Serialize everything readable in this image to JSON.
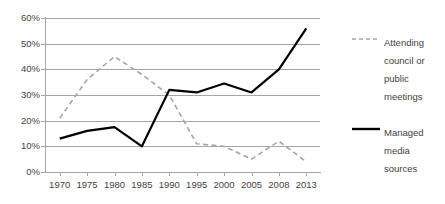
{
  "chart_data": {
    "type": "line",
    "title": "",
    "xlabel": "",
    "ylabel": "",
    "categories": [
      "1970",
      "1975",
      "1980",
      "1985",
      "1990",
      "1995",
      "2000",
      "2005",
      "2008",
      "2013"
    ],
    "ylim": [
      0,
      60
    ],
    "ytick_labels": [
      "0%",
      "10%",
      "20%",
      "30%",
      "40%",
      "50%",
      "60%"
    ],
    "ytick_values": [
      0,
      10,
      20,
      30,
      40,
      50,
      60
    ],
    "grid": true,
    "legend_position": "right",
    "series": [
      {
        "name": "Attending council or public meetings",
        "style": "dashed",
        "color": "#a6a6a6",
        "values": [
          21,
          36,
          45,
          38,
          30,
          11,
          10,
          5,
          12,
          4
        ]
      },
      {
        "name": "Managed media sources",
        "style": "solid",
        "color": "#000000",
        "values": [
          13,
          16,
          17.5,
          10,
          32,
          31,
          34.5,
          31,
          40,
          56
        ]
      }
    ]
  },
  "legend": {
    "entries": [
      {
        "label": "Attending council or public meetings",
        "swatch": "dashed-line-swatch"
      },
      {
        "label": "Managed media sources",
        "swatch": "solid-line-swatch"
      }
    ]
  },
  "colors": {
    "grid": "#a6a6a6",
    "axis": "#a6a6a6",
    "text": "#3f3f3f",
    "series_dashed": "#a6a6a6",
    "series_solid": "#000000",
    "background": "#ffffff"
  }
}
